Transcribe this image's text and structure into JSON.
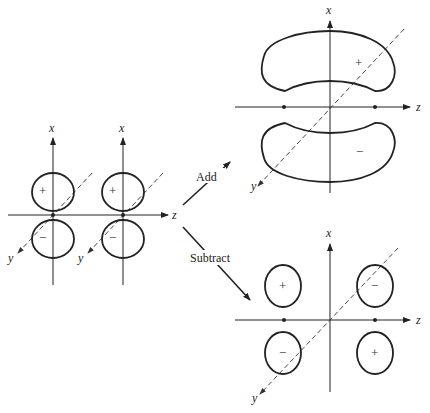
{
  "diagram": {
    "axes": {
      "x": "x",
      "y": "y",
      "z": "z"
    },
    "left": {
      "orbitals": [
        {
          "upper_sign": "+",
          "lower_sign": "−"
        },
        {
          "upper_sign": "+",
          "lower_sign": "−"
        }
      ]
    },
    "arrows": {
      "add_label": "Add",
      "subtract_label": "Subtract"
    },
    "bonding": {
      "upper_sign": "+",
      "lower_sign": "−"
    },
    "antibonding": {
      "top_left_sign": "+",
      "top_right_sign": "−",
      "bottom_left_sign": "−",
      "bottom_right_sign": "+"
    },
    "colors": {
      "line": "#222222",
      "background": "#ffffff"
    }
  }
}
